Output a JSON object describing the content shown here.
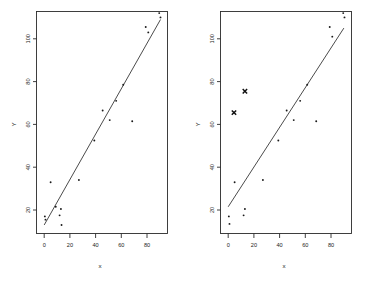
{
  "figure": {
    "background": "#ffffff",
    "ink": "#1d1d1d",
    "panel_count": 2
  },
  "chart_data": [
    {
      "type": "scatter",
      "panel": "left",
      "title": "",
      "xlabel": "x",
      "ylabel": "Y",
      "xlim": [
        -6,
        96
      ],
      "ylim": [
        8,
        116
      ],
      "xticks": [
        0,
        20,
        40,
        60,
        80
      ],
      "yticks": [
        20,
        40,
        60,
        80,
        100
      ],
      "xticklabels": [
        "0",
        "20",
        "40",
        "60",
        "80"
      ],
      "yticklabels": [
        "20",
        "40",
        "60",
        "80",
        "100"
      ],
      "grid": false,
      "legend": false,
      "marker": "point",
      "points": [
        {
          "x": 0.5,
          "y": 17.0
        },
        {
          "x": 1.0,
          "y": 15.5
        },
        {
          "x": 5.0,
          "y": 33.0
        },
        {
          "x": 9.0,
          "y": 21.5
        },
        {
          "x": 12.0,
          "y": 17.5
        },
        {
          "x": 13.0,
          "y": 20.5
        },
        {
          "x": 13.5,
          "y": 13.0
        },
        {
          "x": 27.0,
          "y": 34.0
        },
        {
          "x": 39.0,
          "y": 52.5
        },
        {
          "x": 45.5,
          "y": 66.5
        },
        {
          "x": 51.0,
          "y": 62.0
        },
        {
          "x": 56.0,
          "y": 71.0
        },
        {
          "x": 61.5,
          "y": 78.5
        },
        {
          "x": 68.5,
          "y": 61.5
        },
        {
          "x": 79.0,
          "y": 105.5
        },
        {
          "x": 81.0,
          "y": 103.0
        },
        {
          "x": 89.5,
          "y": 112.0
        },
        {
          "x": 90.5,
          "y": 110.0
        }
      ],
      "fit_line": {
        "name": "least-squares fit",
        "x0": 0.0,
        "y0": 13.0,
        "x1": 90.5,
        "y1": 109.0
      }
    },
    {
      "type": "scatter",
      "panel": "right",
      "title": "",
      "xlabel": "x",
      "ylabel": "Y",
      "xlim": [
        -6,
        96
      ],
      "ylim": [
        8,
        116
      ],
      "xticks": [
        0,
        20,
        40,
        60,
        80
      ],
      "yticks": [
        20,
        40,
        60,
        80,
        100
      ],
      "xticklabels": [
        "0",
        "20",
        "40",
        "60",
        "80"
      ],
      "yticklabels": [
        "20",
        "40",
        "60",
        "80",
        "100"
      ],
      "grid": false,
      "legend": false,
      "marker": "point",
      "points": [
        {
          "x": 0.5,
          "y": 17.0
        },
        {
          "x": 1.0,
          "y": 13.5
        },
        {
          "x": 5.0,
          "y": 33.0
        },
        {
          "x": 12.0,
          "y": 17.5
        },
        {
          "x": 13.0,
          "y": 20.5
        },
        {
          "x": 27.0,
          "y": 34.0
        },
        {
          "x": 39.0,
          "y": 52.5
        },
        {
          "x": 45.5,
          "y": 66.5
        },
        {
          "x": 51.0,
          "y": 62.0
        },
        {
          "x": 56.0,
          "y": 71.0
        },
        {
          "x": 61.5,
          "y": 78.5
        },
        {
          "x": 68.5,
          "y": 61.5
        },
        {
          "x": 79.0,
          "y": 105.5
        },
        {
          "x": 81.0,
          "y": 101.0
        },
        {
          "x": 89.5,
          "y": 112.0
        },
        {
          "x": 90.5,
          "y": 110.0
        }
      ],
      "outliers": [
        {
          "x": 4.5,
          "y": 65.5,
          "marker": "x"
        },
        {
          "x": 13.0,
          "y": 75.5,
          "marker": "x"
        }
      ],
      "fit_line": {
        "name": "least-squares fit",
        "x0": 0.0,
        "y0": 21.5,
        "x1": 90.0,
        "y1": 105.0
      }
    }
  ]
}
